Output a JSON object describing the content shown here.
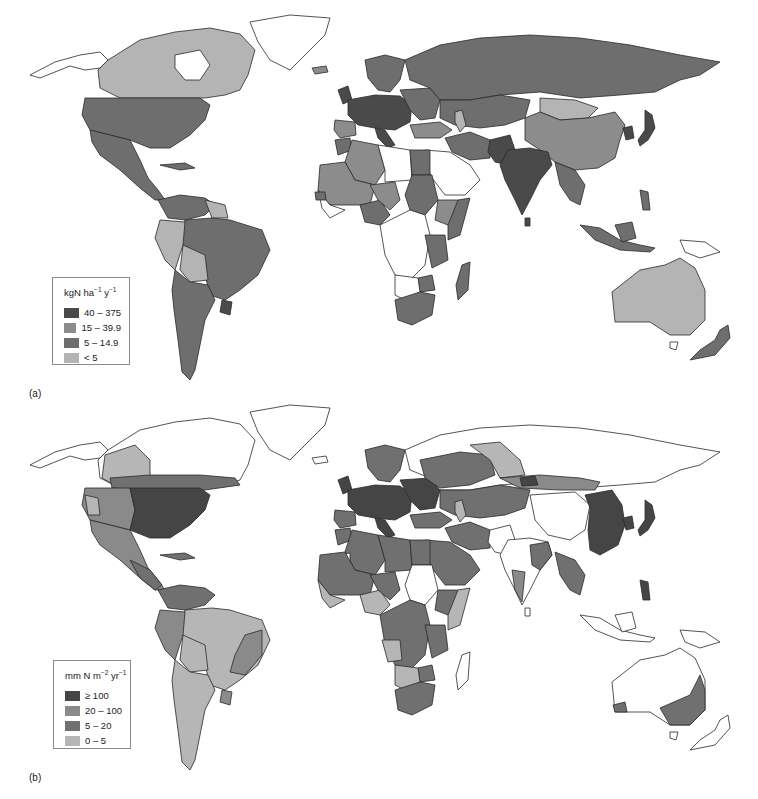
{
  "panels": [
    {
      "id": "a",
      "label": "(a)",
      "legend": {
        "title_base": "kgN  ha",
        "title_sup1": "−1",
        "title_mid": " y",
        "title_sup2": "−1",
        "classes": [
          {
            "label": "40 – 375",
            "color": "#4a4a4a"
          },
          {
            "label": "15 – 39.9",
            "color": "#8c8c8c"
          },
          {
            "label": "5 – 14.9",
            "color": "#6e6e6e"
          },
          {
            "label": "< 5",
            "color": "#b4b4b4"
          }
        ]
      }
    },
    {
      "id": "b",
      "label": "(b)",
      "legend": {
        "title_base": "mm N m",
        "title_sup1": "−2",
        "title_mid": " yr",
        "title_sup2": "−1",
        "classes": [
          {
            "label": "≥ 100",
            "color": "#454545"
          },
          {
            "label": "20 – 100",
            "color": "#8a8a8a"
          },
          {
            "label": "5 – 20",
            "color": "#707070"
          },
          {
            "label": "0 – 5",
            "color": "#b6b6b6"
          }
        ]
      }
    }
  ],
  "colors": {
    "no_data": "#ffffff",
    "border": "#2a2a2a",
    "class_high": "#4a4a4a",
    "class_mid_high": "#8c8c8c",
    "class_mid_low": "#6e6e6e",
    "class_low": "#b4b4b4"
  }
}
